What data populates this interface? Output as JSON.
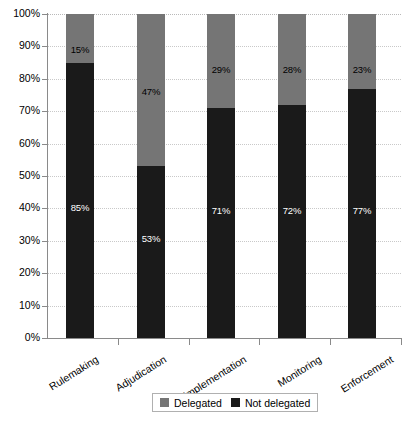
{
  "chart_data": {
    "type": "bar",
    "stacked": true,
    "title": "",
    "subtitle": "",
    "xlabel": "",
    "ylabel": "",
    "ylim": [
      0,
      100
    ],
    "y_tick_labels": [
      "100%",
      "90%",
      "80%",
      "70%",
      "60%",
      "50%",
      "40%",
      "30%",
      "20%",
      "10%",
      "0%"
    ],
    "y_tick_values": [
      100,
      90,
      80,
      70,
      60,
      50,
      40,
      30,
      20,
      10,
      0
    ],
    "grid": true,
    "legend_position": "bottom",
    "categories": [
      "Rulemaking",
      "Adjudication",
      "Implementation",
      "Monitoring",
      "Enforcement"
    ],
    "series": [
      {
        "name": "Not delegated",
        "color": "#1a1a1a",
        "values": [
          85,
          53,
          71,
          72,
          77
        ],
        "value_labels": [
          "85%",
          "53%",
          "71%",
          "72%",
          "77%"
        ]
      },
      {
        "name": "Delegated",
        "color": "#757575",
        "values": [
          15,
          47,
          29,
          28,
          23
        ],
        "value_labels": [
          "15%",
          "47%",
          "29%",
          "28%",
          "23%"
        ]
      }
    ]
  },
  "legend": {
    "items": [
      {
        "label": "Delegated",
        "color": "#757575"
      },
      {
        "label": "Not delegated",
        "color": "#1a1a1a"
      }
    ]
  }
}
